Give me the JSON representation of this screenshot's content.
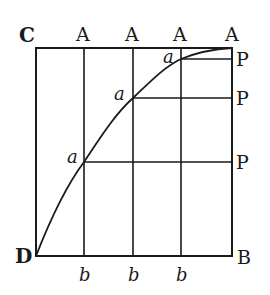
{
  "diagram": {
    "type": "geometric-figure",
    "style": "engraving",
    "colors": {
      "ink": "#1a1a1a",
      "paper": "#ffffff"
    },
    "labels": {
      "corner_top_left": "C",
      "corner_bottom_left": "D",
      "corner_bottom_right": "B",
      "top": [
        "A",
        "A",
        "A",
        "A"
      ],
      "right": [
        "P",
        "P",
        "P"
      ],
      "bottom": [
        "b",
        "b",
        "b"
      ],
      "curve_points": [
        "a",
        "a",
        "a"
      ]
    },
    "geometry": {
      "box": {
        "left": 36,
        "top": 48,
        "right": 232,
        "bottom": 256
      },
      "verticals_x": [
        84,
        133,
        181
      ],
      "horizontals_y": [
        162,
        98,
        59
      ],
      "curve": "D to top-right A through points a"
    }
  }
}
